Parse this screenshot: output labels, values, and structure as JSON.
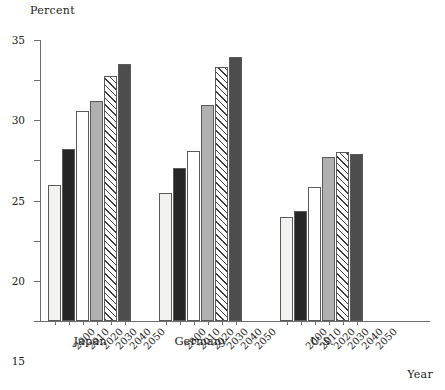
{
  "chart_data": {
    "type": "bar",
    "title": "",
    "ylabel": "Percent",
    "xlabel": "Year",
    "ylim": [
      0,
      35
    ],
    "yticks": [
      0,
      5,
      10,
      15,
      20,
      25,
      30,
      35
    ],
    "grid": false,
    "legend": "none",
    "categories": [
      "2000",
      "2010",
      "2020",
      "2030",
      "2040",
      "2050"
    ],
    "groups": [
      "Japan",
      "Germany",
      "U.S."
    ],
    "series": [
      {
        "name": "Japan",
        "values": [
          16.9,
          21.4,
          26.1,
          27.4,
          30.5,
          32.0
        ]
      },
      {
        "name": "Germany",
        "values": [
          15.9,
          19.0,
          21.2,
          26.9,
          31.7,
          32.9
        ]
      },
      {
        "name": "U.S.",
        "values": [
          13.0,
          13.7,
          16.7,
          20.4,
          21.1,
          20.8
        ]
      }
    ],
    "bar_fills": [
      "near-white",
      "near-black",
      "white",
      "light-gray",
      "diagonal-hatch",
      "dark-gray"
    ],
    "colors": {
      "near-white": "#f2f2f0",
      "near-black": "#262626",
      "white": "#ffffff",
      "light-gray": "#b0b0b0",
      "diagonal-hatch": "#3a3a3a",
      "dark-gray": "#4d4d4d",
      "axis": "#6d6d6d",
      "bar-outline": "#5a5a5a",
      "text": "#1a1a1a"
    }
  }
}
